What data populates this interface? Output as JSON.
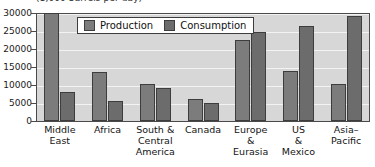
{
  "chart_data": {
    "type": "bar",
    "title": "",
    "axis_units_caption": "(1,000 barrels per day)",
    "xlabel": "",
    "ylabel": "",
    "ylim": [
      0,
      30000
    ],
    "ytick_step": 5000,
    "yticks": [
      "30000",
      "25000",
      "20000",
      "15000",
      "10000",
      "5000",
      "0"
    ],
    "ytick_values": [
      30000,
      25000,
      20000,
      15000,
      10000,
      5000,
      0
    ],
    "grid": true,
    "legend_position": "top-center",
    "categories": [
      "Middle\nEast",
      "Africa",
      "South &\nCentral\nAmerica",
      "Canada",
      "Europe\n&\nEurasia",
      "US\n&\nMexico",
      "Asia–\nPacific"
    ],
    "series": [
      {
        "name": "Production",
        "color": "#7c7c7c",
        "values": [
          30000,
          13700,
          10200,
          6200,
          22500,
          13800,
          10400
        ]
      },
      {
        "name": "Consumption",
        "color": "#6c6c6c",
        "values": [
          8000,
          5500,
          9200,
          5000,
          24800,
          26400,
          29300
        ]
      }
    ]
  },
  "legend": {
    "entries": [
      {
        "label": "Production"
      },
      {
        "label": "Consumption"
      }
    ]
  },
  "colors": {
    "production": "#7c7c7c",
    "consumption": "#6c6c6c",
    "plot_background": "#d7d7d7",
    "gridline": "#f3f3f3",
    "frame": "#4a4a4a",
    "bar_outline": "#3d3d3d",
    "page_background": "#ffffff"
  }
}
